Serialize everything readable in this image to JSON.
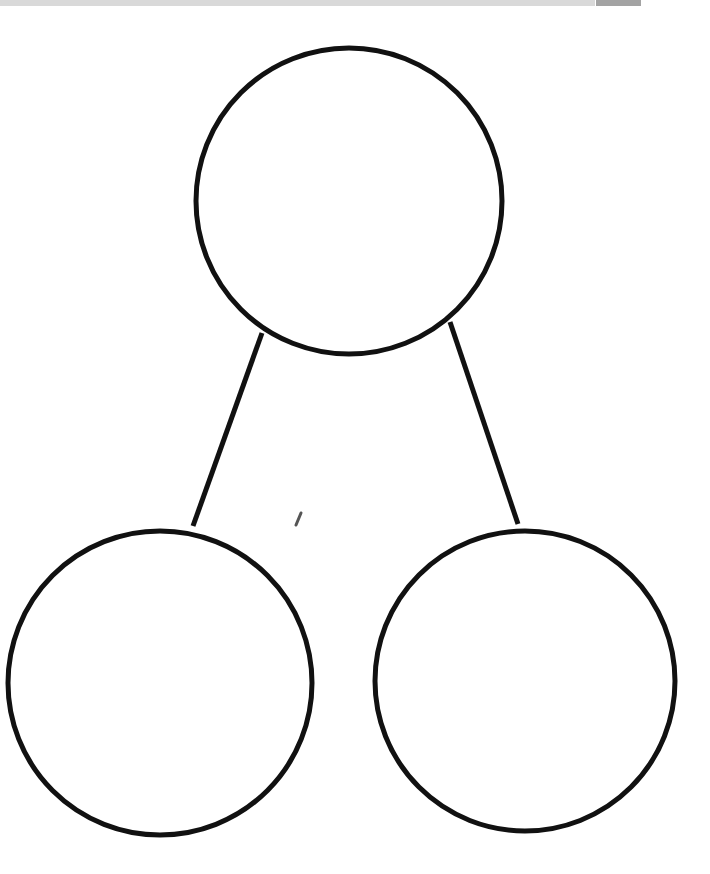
{
  "diagram": {
    "type": "number-bond",
    "stroke_color": "#111111",
    "stroke_width": 5,
    "nodes": [
      {
        "id": "whole",
        "label": "",
        "cx": 349,
        "cy": 201,
        "r": 153
      },
      {
        "id": "part-left",
        "label": "",
        "cx": 160,
        "cy": 683,
        "r": 152
      },
      {
        "id": "part-right",
        "label": "",
        "cx": 525,
        "cy": 681,
        "r": 150
      }
    ],
    "edges": [
      {
        "from": "whole",
        "to": "part-left",
        "x1": 262,
        "y1": 333,
        "x2": 193,
        "y2": 526
      },
      {
        "from": "whole",
        "to": "part-right",
        "x1": 450,
        "y1": 322,
        "x2": 518,
        "y2": 524
      }
    ]
  },
  "top_bar": {
    "bar_color": "#d9d9d9",
    "block_color": "#a3a3a3"
  }
}
